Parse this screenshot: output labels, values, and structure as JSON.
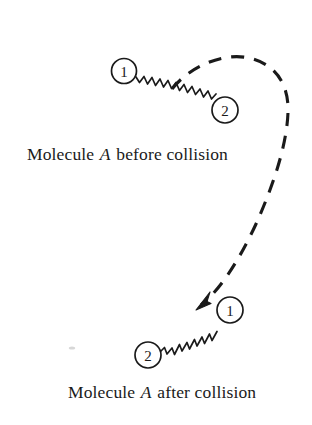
{
  "figure": {
    "title_alt": "Molecule A before and after collision",
    "background_color": "#ffffff",
    "ink_color": "#1a1a1a",
    "captions": {
      "before": {
        "prefix": "Molecule ",
        "symbol": "A",
        "suffix": " before collision"
      },
      "after": {
        "prefix": "Molecule ",
        "symbol": "A",
        "suffix": " after collision"
      }
    },
    "atoms": {
      "before_atom_1": "1",
      "before_atom_2": "2",
      "after_atom_1": "1",
      "after_atom_2": "2"
    },
    "elements": {
      "spring_before_name": "zigzag-bond-spring",
      "spring_after_name": "zigzag-bond-spring",
      "trajectory_name": "dashed-trajectory-curve",
      "arrowhead_name": "trajectory-arrowhead"
    }
  }
}
